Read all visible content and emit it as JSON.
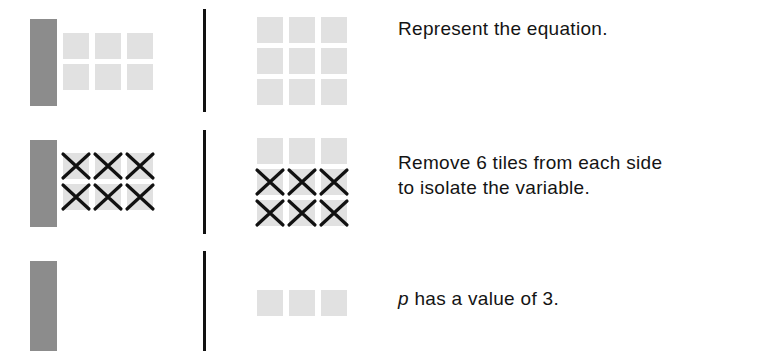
{
  "colors": {
    "variable_bar": "#8c8c8c",
    "unit_tile": "#e1e1e1",
    "divider": "#111111",
    "cross": "#111111",
    "text": "#141414"
  },
  "rows": [
    {
      "left": {
        "variable_bars": 1,
        "unit_tiles": 6,
        "crossed_tiles": 0
      },
      "right": {
        "unit_tiles": 9,
        "crossed_tiles": 0
      },
      "caption": "Represent the equation."
    },
    {
      "left": {
        "variable_bars": 1,
        "unit_tiles": 6,
        "crossed_tiles": 6
      },
      "right": {
        "unit_tiles": 9,
        "crossed_tiles": 6
      },
      "caption_line1": "Remove 6 tiles from each side",
      "caption_line2": "to isolate the variable."
    },
    {
      "left": {
        "variable_bars": 1,
        "unit_tiles": 0,
        "crossed_tiles": 0
      },
      "right": {
        "unit_tiles": 3,
        "crossed_tiles": 0
      },
      "caption_var": "p",
      "caption_rest": " has a value of 3."
    }
  ],
  "icons": {
    "cross": "x-mark-icon"
  }
}
